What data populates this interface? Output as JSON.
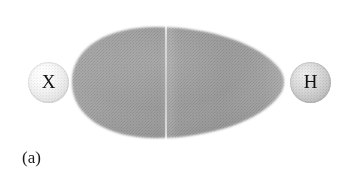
{
  "figure": {
    "caption": "(a)",
    "background_color": "#ffffff",
    "width": 347,
    "height": 180
  },
  "atoms": [
    {
      "id": "x",
      "label": "X",
      "name": "atom-sphere-x",
      "fill_color": "#ececec",
      "edge_color": "#c4c4c4",
      "center_x": 48,
      "center_y": 82,
      "radius": 20
    },
    {
      "id": "h",
      "label": "H",
      "name": "atom-sphere-h",
      "fill_color": "#cfcfcf",
      "edge_color": "#a3a3a3",
      "center_x": 310,
      "center_y": 82,
      "radius": 20
    }
  ],
  "density_lobe": {
    "name": "electron-density-lobe",
    "fill_color": "#9b9b9b",
    "edge_color": "#b8b8b8",
    "left": 64,
    "top": 25,
    "width": 226,
    "height": 115
  },
  "nodal_seam": {
    "name": "nodal-plane-seam",
    "color": "#ffffff",
    "x": 165
  }
}
